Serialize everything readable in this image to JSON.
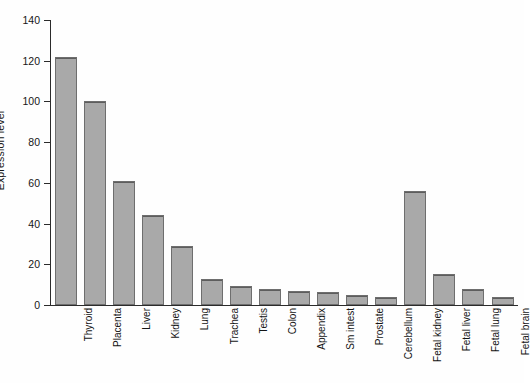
{
  "chart_data": {
    "type": "bar",
    "title": "",
    "subtitle": "",
    "xlabel": "",
    "ylabel": "Expression level",
    "ylim": [
      0,
      140
    ],
    "ytick_labels": [
      "0",
      "20",
      "40",
      "60",
      "80",
      "100",
      "120",
      "140"
    ],
    "ytick_values": [
      0,
      20,
      40,
      60,
      80,
      100,
      120,
      140
    ],
    "grid": false,
    "legend": false,
    "legend_position": "none",
    "bar_color": "#a9a9a9",
    "bar_edge_color": "#6e6e6e",
    "axis_color": "#2b2b2b",
    "background_color": "#ffffff",
    "categories": [
      "Thyroid",
      "Placenta",
      "Liver",
      "Kidney",
      "Lung",
      "Trachea",
      "Testis",
      "Colon",
      "Appendix",
      "Sm intest",
      "Prostate",
      "Cerebellum",
      "Fetal kidney",
      "Fetal liver",
      "Fetal lung",
      "Fetal brain"
    ],
    "values": [
      122,
      100,
      61,
      44,
      29,
      13,
      9.5,
      8,
      7,
      6.5,
      5,
      4,
      56,
      15,
      8,
      4
    ]
  }
}
